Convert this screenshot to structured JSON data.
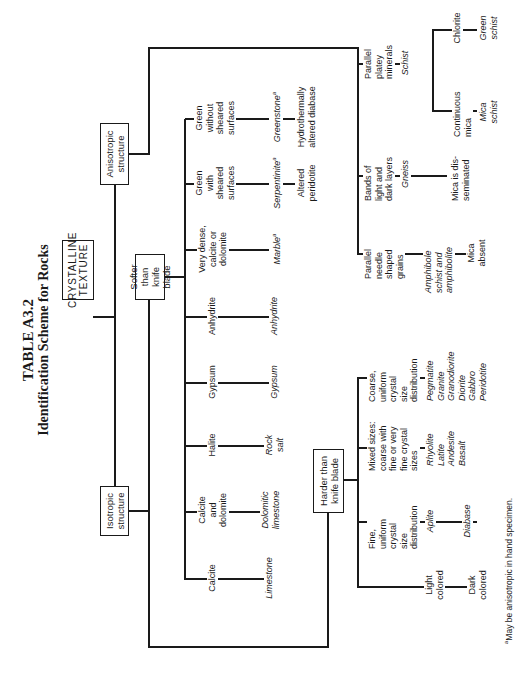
{
  "title": {
    "table_number": "TABLE A3.2",
    "subtitle": "Identification Scheme for Rocks"
  },
  "root": {
    "label": "CRYSTALLINE\nTEXTURE"
  },
  "level1": {
    "isotropic": "Isotropic\nstructure",
    "anisotropic": "Anisotropic\nstructure"
  },
  "level2": {
    "softer": "Softer than\nknife blade",
    "harder": "Harder than\nknife blade"
  },
  "softer_branches": [
    {
      "property": "Calcite",
      "rock": "Limestone",
      "extra": ""
    },
    {
      "property": "Calcite\nand\ndolomite",
      "rock": "Dolomitic\nlimestone",
      "extra": ""
    },
    {
      "property": "Halite",
      "rock": "Rock\nsalt",
      "extra": ""
    },
    {
      "property": "Gypsum",
      "rock": "Gypsum",
      "extra": ""
    },
    {
      "property": "Anhydrite",
      "rock": "Anhydrite",
      "extra": ""
    },
    {
      "property": "Very dense,\ncalcite or\ndolomite",
      "rock": "Marble",
      "rock_note": "a",
      "extra": ""
    },
    {
      "property": "Green\nwith\nsheared\nsurfaces",
      "rock": "Serpentinite",
      "rock_note": "a",
      "extra": "Altered\nperidotite"
    },
    {
      "property": "Green\nwithout\nsheared\nsurfaces",
      "rock": "Greenstone",
      "rock_note": "a",
      "extra": "Hydrothermally\naltered diabase"
    }
  ],
  "harder_branches": [
    {
      "property": "Light\ncolored",
      "rock": "",
      "extra": "Dark\ncolored"
    },
    {
      "property": "Fine,\nuniform\ncrystal\nsize\ndistribution",
      "rock": "Aplite",
      "extra": "Diabase"
    },
    {
      "property": "Mixed sizes:\ncoarse with\nfine or very\nfine crystal\nsizes",
      "rock": "Rhyolite\nLatite\nAndesite\nBasalt",
      "extra": ""
    },
    {
      "property": "Coarse,\nuniform\ncrystal\nsize\ndistribution",
      "rock": "Pegmatite\nGranite\nGranodiorite\nDiorite\nGabbro\nPeridotite",
      "extra": ""
    }
  ],
  "anisotropic_branches": [
    {
      "property": "Parallel\nneedle\nshaped\ngrains",
      "rock": "Amphibole\nschist and\namphibolite",
      "extra": "Mica\nabsent"
    },
    {
      "property": "Bands of\nlight and\ndark layers",
      "rock": "Gneiss",
      "extra": "Mica is dis-\nseminated"
    },
    {
      "property": "Parallel\nplatey\nminerals",
      "rock": "Schist",
      "sub": [
        {
          "property": "Continuous\nmica",
          "rock": "Mica\nschist"
        },
        {
          "property": "Chlorite",
          "rock": "Green\nschist"
        }
      ]
    }
  ],
  "footnote": {
    "mark": "a",
    "text": "May be anisotropic in hand specimen."
  },
  "colors": {
    "ink": "#1a1a1a",
    "paper": "#ffffff"
  }
}
